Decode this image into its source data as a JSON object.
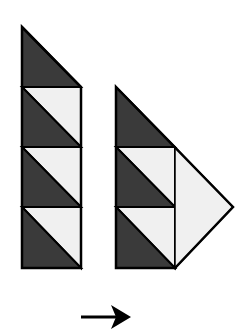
{
  "diagram": {
    "colors": {
      "dark": "#3a3a3a",
      "light": "#f0f0f0",
      "stroke": "#000000",
      "background": "#ffffff"
    },
    "left_strip": {
      "pieces": [
        "dark-triangle-top",
        "hst-1",
        "hst-2",
        "hst-3"
      ]
    },
    "right_shape": {
      "pieces": [
        "dark-triangle-top",
        "hst-1",
        "hst-2",
        "light-triangle-side"
      ]
    },
    "arrow": {
      "direction": "right",
      "icon": "arrow-right-icon"
    }
  }
}
